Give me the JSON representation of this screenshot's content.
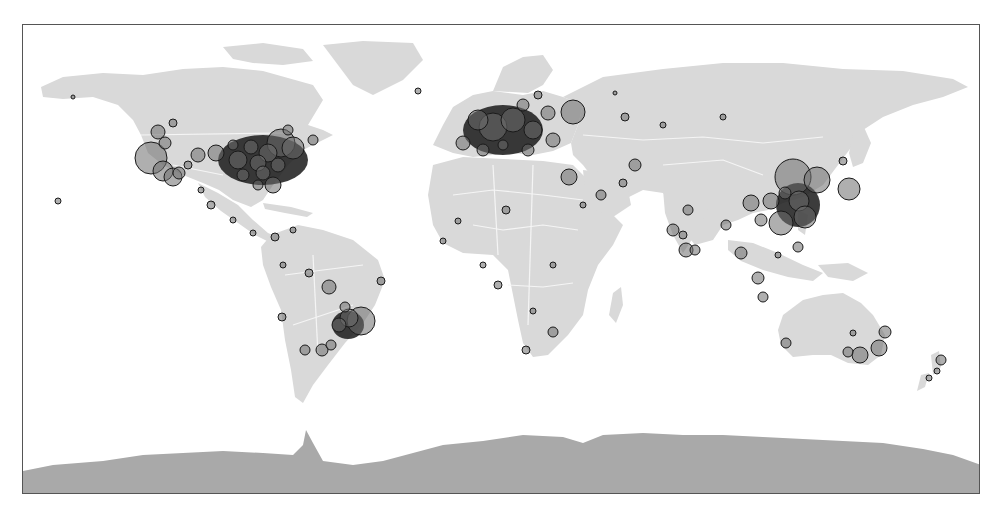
{
  "map": {
    "projection": "equirectangular",
    "width": 958,
    "height": 470,
    "colors": {
      "background": "#ffffff",
      "land": "#d9d9d9",
      "antarctica": "#a9a9a9",
      "borders": "#f5f5f5",
      "bubble_fill": "#6e6e6e",
      "bubble_fill_opacity": 0.55,
      "bubble_stroke": "#1a1a1a",
      "frame": "#555555"
    },
    "landmasses": [
      {
        "name": "north-america",
        "d": "M18,62 L40,52 L80,48 L120,50 L160,44 L200,42 L240,46 L290,60 L300,75 L285,100 L300,105 L310,110 L280,125 L265,140 L250,160 L240,175 L228,182 L210,175 L196,165 L180,158 L160,150 L140,140 L125,128 L118,110 L110,95 L95,80 L70,72 L40,74 L20,72 Z"
      },
      {
        "name": "greenland",
        "d": "M300,20 L340,16 L390,18 L400,35 L380,55 L350,70 L330,60 L315,40 Z"
      },
      {
        "name": "arctic-islands",
        "d": "M200,22 L240,18 L280,24 L290,36 L260,40 L230,38 L210,34 Z"
      },
      {
        "name": "central-america",
        "d": "M175,158 L195,168 L215,180 L230,195 L245,208 L255,212 L248,218 L232,210 L215,198 L198,186 L182,172 Z"
      },
      {
        "name": "cuba-caribbean",
        "d": "M240,178 L268,182 L290,188 L284,192 L262,188 L242,184 Z"
      },
      {
        "name": "south-america",
        "d": "M248,210 L275,200 L300,205 L330,215 L355,235 L362,255 L352,280 L340,298 L322,318 L305,340 L290,360 L280,378 L272,372 L268,345 L262,315 L258,285 L248,262 L240,240 L238,222 Z"
      },
      {
        "name": "europe",
        "d": "M410,120 L420,100 L430,82 L450,70 L470,66 L500,70 L520,66 L540,72 L560,80 L555,100 L548,118 L530,126 L510,130 L490,128 L470,130 L450,132 L430,128 Z"
      },
      {
        "name": "scandinavia",
        "d": "M470,66 L480,42 L500,32 L520,30 L530,45 L520,60 L505,68 Z"
      },
      {
        "name": "uk",
        "d": "M440,80 L450,72 L455,88 L448,100 L440,95 Z"
      },
      {
        "name": "africa",
        "d": "M410,140 L440,132 L480,134 L520,136 L550,140 L570,160 L585,185 L600,200 L590,220 L575,240 L565,265 L560,290 L545,310 L525,330 L510,332 L500,318 L495,295 L490,270 L485,245 L470,230 L440,228 L420,218 L410,200 L405,170 Z"
      },
      {
        "name": "madagascar",
        "d": "M590,268 L598,262 L600,280 L593,298 L586,290 Z"
      },
      {
        "name": "asia",
        "d": "M540,72 L580,52 L640,44 L700,38 L760,38 L820,44 L880,46 L930,54 L945,62 L920,72 L890,80 L860,92 L840,105 L830,120 L815,140 L800,160 L780,172 L760,178 L745,185 L730,188 L715,195 L700,200 L690,215 L672,220 L660,205 L650,180 L640,168 L620,165 L600,175 L585,180 L575,160 L560,140 L550,130 L548,118 L555,100 L560,80 Z"
      },
      {
        "name": "arabia",
        "d": "M560,145 L585,148 L605,165 L608,180 L590,192 L572,185 L562,165 Z"
      },
      {
        "name": "india",
        "d": "M640,165 L670,168 L685,185 L672,210 L660,228 L650,210 L642,188 Z"
      },
      {
        "name": "southeast-asia-islands",
        "d": "M705,215 L730,218 L755,228 L780,240 L800,248 L790,256 L765,252 L740,245 L718,236 L705,225 Z"
      },
      {
        "name": "japan",
        "d": "M830,110 L840,100 L848,118 L840,138 L830,142 L826,128 Z"
      },
      {
        "name": "philippines",
        "d": "M775,185 L785,190 L782,210 L775,205 Z"
      },
      {
        "name": "new-guinea",
        "d": "M795,240 L825,238 L845,248 L830,256 L805,252 Z"
      },
      {
        "name": "australia",
        "d": "M760,290 L780,275 L800,270 L820,268 L838,278 L850,290 L862,310 L858,330 L845,340 L825,338 L808,330 L790,330 L770,332 L758,320 L755,305 Z"
      },
      {
        "name": "new-zealand",
        "d": "M908,330 L916,326 L918,342 L910,350 Z M898,350 L906,348 L902,362 L894,366 Z"
      },
      {
        "name": "antarctica",
        "d": "M0,446 L30,440 L80,436 L120,430 L160,428 L200,426 L240,428 L270,430 L280,420 L283,405 L290,418 L300,436 L330,440 L360,436 L390,428 L420,420 L460,416 L500,410 L540,412 L560,418 L580,410 L620,408 L660,410 L700,410 L740,412 L780,414 L820,416 L860,418 L900,424 L930,430 L958,440 L958,470 L0,470 Z"
      }
    ],
    "borders": [
      {
        "name": "us-canada",
        "d": "M118,110 L260,108"
      },
      {
        "name": "us-mexico",
        "d": "M150,140 L200,150"
      },
      {
        "name": "africa-north",
        "d": "M430,170 L470,165 L520,170 L560,175"
      },
      {
        "name": "africa-central",
        "d": "M450,200 L480,205 L520,200 L555,205"
      },
      {
        "name": "africa-south",
        "d": "M485,260 L520,262 L550,258"
      },
      {
        "name": "africa-vert-1",
        "d": "M470,140 L475,230"
      },
      {
        "name": "africa-vert-2",
        "d": "M510,140 L505,300"
      },
      {
        "name": "russia-south",
        "d": "M560,110 L620,115 L680,112 L740,118 L800,112"
      },
      {
        "name": "china-west",
        "d": "M640,140 L700,135 L740,150"
      },
      {
        "name": "south-america-1",
        "d": "M262,250 L300,245 L340,240"
      },
      {
        "name": "south-america-2",
        "d": "M270,300 L300,290 L330,280"
      },
      {
        "name": "south-america-3",
        "d": "M290,230 L295,330"
      }
    ],
    "bubbles": [
      {
        "region": "north-america",
        "cx": 128,
        "cy": 133,
        "r": 16
      },
      {
        "region": "north-america",
        "cx": 140,
        "cy": 146,
        "r": 10
      },
      {
        "region": "north-america",
        "cx": 150,
        "cy": 152,
        "r": 9
      },
      {
        "region": "north-america",
        "cx": 135,
        "cy": 107,
        "r": 7
      },
      {
        "region": "north-america",
        "cx": 142,
        "cy": 118,
        "r": 6
      },
      {
        "region": "north-america",
        "cx": 156,
        "cy": 148,
        "r": 6
      },
      {
        "region": "north-america",
        "cx": 175,
        "cy": 130,
        "r": 7
      },
      {
        "region": "north-america",
        "cx": 193,
        "cy": 128,
        "r": 8
      },
      {
        "region": "north-america",
        "cx": 215,
        "cy": 135,
        "r": 9
      },
      {
        "region": "north-america",
        "cx": 258,
        "cy": 118,
        "r": 14
      },
      {
        "region": "north-america",
        "cx": 270,
        "cy": 123,
        "r": 11
      },
      {
        "region": "north-america",
        "cx": 245,
        "cy": 128,
        "r": 9
      },
      {
        "region": "north-america",
        "cx": 235,
        "cy": 138,
        "r": 8
      },
      {
        "region": "north-america",
        "cx": 228,
        "cy": 122,
        "r": 7
      },
      {
        "region": "north-america",
        "cx": 240,
        "cy": 148,
        "r": 7
      },
      {
        "region": "north-america",
        "cx": 255,
        "cy": 140,
        "r": 7
      },
      {
        "region": "north-america",
        "cx": 250,
        "cy": 160,
        "r": 8
      },
      {
        "region": "north-america",
        "cx": 235,
        "cy": 160,
        "r": 5
      },
      {
        "region": "north-america",
        "cx": 220,
        "cy": 150,
        "r": 6
      },
      {
        "region": "north-america",
        "cx": 265,
        "cy": 105,
        "r": 5
      },
      {
        "region": "north-america",
        "cx": 210,
        "cy": 120,
        "r": 5
      },
      {
        "region": "north-america",
        "cx": 165,
        "cy": 140,
        "r": 4
      },
      {
        "region": "north-america",
        "cx": 150,
        "cy": 98,
        "r": 4
      },
      {
        "region": "north-america",
        "cx": 178,
        "cy": 165,
        "r": 3
      },
      {
        "region": "north-america",
        "cx": 290,
        "cy": 115,
        "r": 5
      },
      {
        "region": "north-america",
        "cx": 50,
        "cy": 72,
        "r": 2
      },
      {
        "region": "north-america",
        "cx": 35,
        "cy": 176,
        "r": 3
      },
      {
        "region": "central-america",
        "cx": 188,
        "cy": 180,
        "r": 4
      },
      {
        "region": "central-america",
        "cx": 210,
        "cy": 195,
        "r": 3
      },
      {
        "region": "central-america",
        "cx": 230,
        "cy": 208,
        "r": 3
      },
      {
        "region": "central-america",
        "cx": 252,
        "cy": 212,
        "r": 4
      },
      {
        "region": "south-america",
        "cx": 306,
        "cy": 262,
        "r": 7
      },
      {
        "region": "south-america",
        "cx": 338,
        "cy": 296,
        "r": 14
      },
      {
        "region": "south-america",
        "cx": 326,
        "cy": 293,
        "r": 9
      },
      {
        "region": "south-america",
        "cx": 316,
        "cy": 300,
        "r": 7
      },
      {
        "region": "south-america",
        "cx": 322,
        "cy": 282,
        "r": 5
      },
      {
        "region": "south-america",
        "cx": 299,
        "cy": 325,
        "r": 6
      },
      {
        "region": "south-america",
        "cx": 282,
        "cy": 325,
        "r": 5
      },
      {
        "region": "south-america",
        "cx": 308,
        "cy": 320,
        "r": 5
      },
      {
        "region": "south-america",
        "cx": 259,
        "cy": 292,
        "r": 4
      },
      {
        "region": "south-america",
        "cx": 286,
        "cy": 248,
        "r": 4
      },
      {
        "region": "south-america",
        "cx": 260,
        "cy": 240,
        "r": 3
      },
      {
        "region": "south-america",
        "cx": 358,
        "cy": 256,
        "r": 4
      },
      {
        "region": "south-america",
        "cx": 270,
        "cy": 205,
        "r": 3
      },
      {
        "region": "europe",
        "cx": 470,
        "cy": 102,
        "r": 14
      },
      {
        "region": "europe",
        "cx": 455,
        "cy": 95,
        "r": 10
      },
      {
        "region": "europe",
        "cx": 490,
        "cy": 95,
        "r": 12
      },
      {
        "region": "europe",
        "cx": 510,
        "cy": 105,
        "r": 9
      },
      {
        "region": "europe",
        "cx": 550,
        "cy": 87,
        "r": 12
      },
      {
        "region": "europe",
        "cx": 525,
        "cy": 88,
        "r": 7
      },
      {
        "region": "europe",
        "cx": 440,
        "cy": 118,
        "r": 7
      },
      {
        "region": "europe",
        "cx": 460,
        "cy": 125,
        "r": 6
      },
      {
        "region": "europe",
        "cx": 505,
        "cy": 125,
        "r": 6
      },
      {
        "region": "europe",
        "cx": 530,
        "cy": 115,
        "r": 7
      },
      {
        "region": "europe",
        "cx": 500,
        "cy": 80,
        "r": 6
      },
      {
        "region": "europe",
        "cx": 480,
        "cy": 120,
        "r": 5
      },
      {
        "region": "europe",
        "cx": 515,
        "cy": 70,
        "r": 4
      },
      {
        "region": "europe",
        "cx": 395,
        "cy": 66,
        "r": 3
      },
      {
        "region": "middle-east",
        "cx": 546,
        "cy": 152,
        "r": 8
      },
      {
        "region": "middle-east",
        "cx": 578,
        "cy": 170,
        "r": 5
      },
      {
        "region": "middle-east",
        "cx": 612,
        "cy": 140,
        "r": 6
      },
      {
        "region": "middle-east",
        "cx": 600,
        "cy": 158,
        "r": 4
      },
      {
        "region": "middle-east",
        "cx": 560,
        "cy": 180,
        "r": 3
      },
      {
        "region": "africa",
        "cx": 483,
        "cy": 185,
        "r": 4
      },
      {
        "region": "africa",
        "cx": 475,
        "cy": 260,
        "r": 4
      },
      {
        "region": "africa",
        "cx": 530,
        "cy": 307,
        "r": 5
      },
      {
        "region": "africa",
        "cx": 503,
        "cy": 325,
        "r": 4
      },
      {
        "region": "africa",
        "cx": 460,
        "cy": 240,
        "r": 3
      },
      {
        "region": "africa",
        "cx": 435,
        "cy": 196,
        "r": 3
      },
      {
        "region": "africa",
        "cx": 420,
        "cy": 216,
        "r": 3
      },
      {
        "region": "africa",
        "cx": 530,
        "cy": 240,
        "r": 3
      },
      {
        "region": "africa",
        "cx": 510,
        "cy": 286,
        "r": 3
      },
      {
        "region": "russia",
        "cx": 602,
        "cy": 92,
        "r": 4
      },
      {
        "region": "russia",
        "cx": 640,
        "cy": 100,
        "r": 3
      },
      {
        "region": "russia",
        "cx": 700,
        "cy": 92,
        "r": 3
      },
      {
        "region": "russia",
        "cx": 592,
        "cy": 68,
        "r": 2
      },
      {
        "region": "east-asia",
        "cx": 770,
        "cy": 152,
        "r": 18
      },
      {
        "region": "east-asia",
        "cx": 794,
        "cy": 155,
        "r": 13
      },
      {
        "region": "east-asia",
        "cx": 826,
        "cy": 164,
        "r": 11
      },
      {
        "region": "east-asia",
        "cx": 776,
        "cy": 176,
        "r": 10
      },
      {
        "region": "east-asia",
        "cx": 782,
        "cy": 192,
        "r": 11
      },
      {
        "region": "east-asia",
        "cx": 758,
        "cy": 198,
        "r": 12
      },
      {
        "region": "east-asia",
        "cx": 748,
        "cy": 176,
        "r": 8
      },
      {
        "region": "east-asia",
        "cx": 728,
        "cy": 178,
        "r": 8
      },
      {
        "region": "east-asia",
        "cx": 762,
        "cy": 168,
        "r": 6
      },
      {
        "region": "east-asia",
        "cx": 738,
        "cy": 195,
        "r": 6
      },
      {
        "region": "east-asia",
        "cx": 820,
        "cy": 136,
        "r": 4
      },
      {
        "region": "east-asia",
        "cx": 703,
        "cy": 200,
        "r": 5
      },
      {
        "region": "south-asia",
        "cx": 665,
        "cy": 185,
        "r": 5
      },
      {
        "region": "south-asia",
        "cx": 650,
        "cy": 205,
        "r": 6
      },
      {
        "region": "south-asia",
        "cx": 663,
        "cy": 225,
        "r": 7
      },
      {
        "region": "south-asia",
        "cx": 672,
        "cy": 225,
        "r": 5
      },
      {
        "region": "south-asia",
        "cx": 660,
        "cy": 210,
        "r": 4
      },
      {
        "region": "southeast-asia",
        "cx": 718,
        "cy": 228,
        "r": 6
      },
      {
        "region": "southeast-asia",
        "cx": 735,
        "cy": 253,
        "r": 6
      },
      {
        "region": "southeast-asia",
        "cx": 740,
        "cy": 272,
        "r": 5
      },
      {
        "region": "southeast-asia",
        "cx": 775,
        "cy": 222,
        "r": 5
      },
      {
        "region": "southeast-asia",
        "cx": 755,
        "cy": 230,
        "r": 3
      },
      {
        "region": "australia",
        "cx": 763,
        "cy": 318,
        "r": 5
      },
      {
        "region": "australia",
        "cx": 837,
        "cy": 330,
        "r": 8
      },
      {
        "region": "australia",
        "cx": 856,
        "cy": 323,
        "r": 8
      },
      {
        "region": "australia",
        "cx": 825,
        "cy": 327,
        "r": 5
      },
      {
        "region": "australia",
        "cx": 862,
        "cy": 307,
        "r": 6
      },
      {
        "region": "australia",
        "cx": 830,
        "cy": 308,
        "r": 3
      },
      {
        "region": "new-zealand",
        "cx": 918,
        "cy": 335,
        "r": 5
      },
      {
        "region": "new-zealand",
        "cx": 914,
        "cy": 346,
        "r": 3
      },
      {
        "region": "new-zealand",
        "cx": 906,
        "cy": 353,
        "r": 3
      }
    ],
    "density_clusters": [
      {
        "region": "eastern-usa",
        "cx": 240,
        "cy": 135,
        "rx": 45,
        "ry": 25
      },
      {
        "region": "western-europe",
        "cx": 480,
        "cy": 105,
        "rx": 40,
        "ry": 25
      },
      {
        "region": "southeast-brazil",
        "cx": 325,
        "cy": 300,
        "rx": 16,
        "ry": 14
      },
      {
        "region": "eastern-china",
        "cx": 775,
        "cy": 180,
        "rx": 22,
        "ry": 22
      }
    ]
  }
}
